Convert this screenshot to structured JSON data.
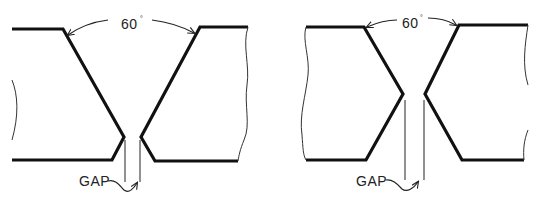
{
  "diagram": {
    "type": "welding-joint-cross-sections",
    "stroke_color": "#111111",
    "background": "#ffffff",
    "figures": [
      {
        "id": "single-v-groove",
        "angle_label": "60",
        "angle_unit": "°",
        "gap_label": "GAP"
      },
      {
        "id": "double-v-groove",
        "angle_label": "60",
        "angle_unit": "°",
        "gap_label": "GAP"
      }
    ]
  }
}
